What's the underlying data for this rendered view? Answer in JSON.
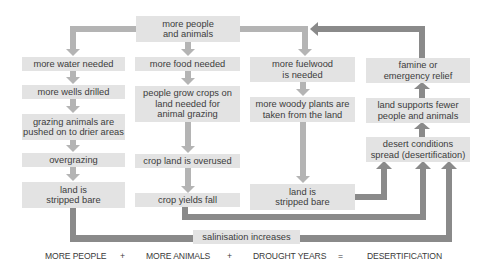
{
  "diagram": {
    "title_box": {
      "label": "more people\nand animals"
    },
    "columns": [
      {
        "name": "water",
        "boxes": [
          {
            "label": "more water needed"
          },
          {
            "label": "more wells drilled"
          },
          {
            "label": "grazing animals are\npushed on to drier areas"
          },
          {
            "label": "overgrazing"
          },
          {
            "label": "land is\nstripped bare"
          }
        ]
      },
      {
        "name": "food",
        "boxes": [
          {
            "label": "more food needed"
          },
          {
            "label": "people grow crops on\nland needed for\nanimal grazing"
          },
          {
            "label": "crop land is overused"
          },
          {
            "label": "crop yields fall"
          }
        ]
      },
      {
        "name": "fuelwood",
        "boxes": [
          {
            "label": "more fuelwood\nis needed"
          },
          {
            "label": "more woody plants are\ntaken from the land"
          },
          {
            "label": "land is\nstripped bare"
          }
        ]
      },
      {
        "name": "outcome",
        "boxes": [
          {
            "label": "famine or\nemergency relief"
          },
          {
            "label": "land supports fewer\npeople and animals"
          },
          {
            "label": "desert conditions\nspread (desertification)"
          }
        ]
      }
    ],
    "salinisation_box": {
      "label": "salinisation increases"
    },
    "equation": {
      "term1": "MORE PEOPLE",
      "plus1": "+",
      "term2": "MORE ANIMALS",
      "plus2": "+",
      "term3": "DROUGHT YEARS",
      "equals": "=",
      "result": "DESERTIFICATION"
    },
    "colors": {
      "box_fill": "#e3e3e3",
      "flow_arrow": "#b4b4b4",
      "feedback_arrow": "#8a8a8a",
      "text": "#3c3c3c"
    }
  }
}
